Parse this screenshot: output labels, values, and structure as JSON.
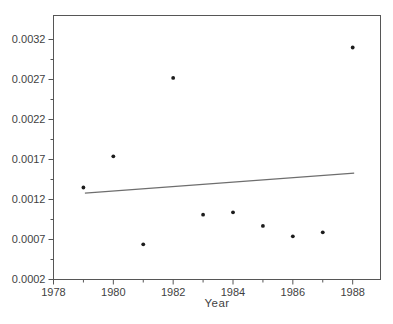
{
  "chart_data": {
    "type": "scatter",
    "title": "",
    "xlabel": "Year",
    "ylabel": "",
    "xlim": [
      1978,
      1988.93
    ],
    "ylim": [
      0.0002,
      0.0035
    ],
    "x_major_ticks": [
      1978,
      1980,
      1982,
      1984,
      1986,
      1988
    ],
    "x_tick_labels": [
      "1978",
      "1980",
      "1982",
      "1984",
      "1986",
      "1988"
    ],
    "x_minor_ticks": [
      1979,
      1981,
      1983,
      1985,
      1987
    ],
    "y_major_ticks": [
      0.0002,
      0.0007,
      0.0012,
      0.0017,
      0.0022,
      0.0027,
      0.0032
    ],
    "y_tick_labels": [
      "0.0002",
      "0.0007",
      "0.0012",
      "0.0017",
      "0.0022",
      "0.0027",
      "0.0032"
    ],
    "y_minor_ticks": [
      0.00045,
      0.00095,
      0.00145,
      0.00195,
      0.00245,
      0.00295
    ],
    "grid": false,
    "legend": null,
    "points": [
      {
        "x": 1979,
        "y": 0.00135
      },
      {
        "x": 1980,
        "y": 0.00174
      },
      {
        "x": 1981,
        "y": 0.00064
      },
      {
        "x": 1982,
        "y": 0.00272
      },
      {
        "x": 1983,
        "y": 0.00101
      },
      {
        "x": 1984,
        "y": 0.00104
      },
      {
        "x": 1985,
        "y": 0.00087
      },
      {
        "x": 1986,
        "y": 0.00074
      },
      {
        "x": 1987,
        "y": 0.00079
      },
      {
        "x": 1988,
        "y": 0.0031
      }
    ],
    "trend_line": {
      "x1": 1979.05,
      "y1": 0.00128,
      "x2": 1988.05,
      "y2": 0.00153
    },
    "colors": {
      "background": "#ffffff",
      "frame": "#565656",
      "tick": "#565656",
      "text": "#3f3f3f",
      "point": "#1c1c1c",
      "trend": "#6e6e6e"
    }
  }
}
